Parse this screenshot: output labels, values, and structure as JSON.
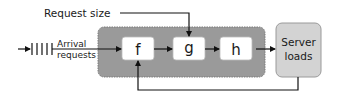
{
  "diagram": {
    "input_label": "Request size",
    "arrival_label_line1": "Arrival",
    "arrival_label_line2": "requests",
    "stages": [
      {
        "id": "f",
        "label": "f"
      },
      {
        "id": "g",
        "label": "g"
      },
      {
        "id": "h",
        "label": "h"
      }
    ],
    "output_label_line1": "Server",
    "output_label_line2": "loads",
    "colors": {
      "container_fill": "#9a9a9a",
      "stage_fill": "#ffffff",
      "output_fill": "#d3d3d3",
      "line": "#111111"
    }
  }
}
